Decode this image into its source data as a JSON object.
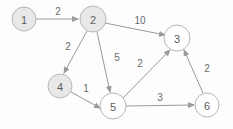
{
  "diagram": {
    "type": "directed-weighted-graph",
    "canvas": {
      "width": 233,
      "height": 129,
      "background": "#fdfdfd"
    },
    "style": {
      "node_stroke": "#b8b8b8",
      "node_fill_shaded": "#e8e8e8",
      "node_fill_plain": "#ffffff",
      "edge_color": "#9a9a9a",
      "node_label_color": "#5d5d5d",
      "edge_label_color": "#6b6b6b",
      "node_radius": 12
    },
    "nodes": [
      {
        "id": "1",
        "label": "1",
        "cx": 24,
        "cy": 19,
        "r": 12,
        "fill": "#e8e8e8"
      },
      {
        "id": "2",
        "label": "2",
        "cx": 93,
        "cy": 19,
        "r": 13,
        "fill": "#e8e8e8"
      },
      {
        "id": "3",
        "label": "3",
        "cx": 177,
        "cy": 38,
        "r": 13,
        "fill": "#ffffff"
      },
      {
        "id": "4",
        "label": "4",
        "cx": 60,
        "cy": 86,
        "r": 12,
        "fill": "#e8e8e8"
      },
      {
        "id": "5",
        "label": "5",
        "cx": 113,
        "cy": 106,
        "r": 13,
        "fill": "#ffffff"
      },
      {
        "id": "6",
        "label": "6",
        "cx": 207,
        "cy": 105,
        "r": 12,
        "fill": "#ffffff"
      }
    ],
    "edges": [
      {
        "id": "e12",
        "from": "1",
        "to": "2",
        "weight": "2",
        "x1": 36,
        "y1": 19,
        "x2": 78,
        "y2": 19,
        "lx": 58,
        "ly": 11
      },
      {
        "id": "e23",
        "from": "2",
        "to": "3",
        "weight": "10",
        "x1": 105,
        "y1": 23,
        "x2": 165,
        "y2": 35,
        "lx": 140,
        "ly": 20
      },
      {
        "id": "e24",
        "from": "2",
        "to": "4",
        "weight": "2",
        "x1": 87,
        "y1": 31,
        "x2": 64,
        "y2": 73,
        "lx": 68,
        "ly": 46
      },
      {
        "id": "e25",
        "from": "2",
        "to": "5",
        "weight": "5",
        "x1": 97,
        "y1": 32,
        "x2": 110,
        "y2": 92,
        "lx": 117,
        "ly": 57
      },
      {
        "id": "e45",
        "from": "4",
        "to": "5",
        "weight": "1",
        "x1": 71,
        "y1": 92,
        "x2": 100,
        "y2": 108,
        "lx": 86,
        "ly": 88
      },
      {
        "id": "e53",
        "from": "5",
        "to": "3",
        "weight": "2",
        "x1": 123,
        "y1": 98,
        "x2": 170,
        "y2": 50,
        "lx": 140,
        "ly": 63
      },
      {
        "id": "e56",
        "from": "5",
        "to": "6",
        "weight": "3",
        "x1": 126,
        "y1": 106,
        "x2": 194,
        "y2": 105,
        "lx": 160,
        "ly": 97
      },
      {
        "id": "e63",
        "from": "6",
        "to": "3",
        "weight": "2",
        "x1": 203,
        "y1": 93,
        "x2": 184,
        "y2": 50,
        "lx": 207,
        "ly": 68
      }
    ]
  }
}
